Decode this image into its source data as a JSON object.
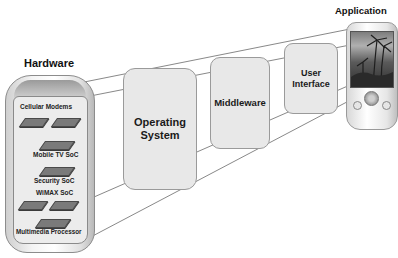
{
  "diagram": {
    "type": "layered-architecture-perspective",
    "colors": {
      "box_fill": "#e8e8e8",
      "box_border": "#9a9a9a",
      "line": "#666666",
      "text": "#1a1a1a",
      "chip": "#7a7a7a"
    },
    "hardware": {
      "label": "Hardware",
      "components": [
        {
          "label": "Cellular Modems"
        },
        {
          "label": "Mobile TV SoC"
        },
        {
          "label": "Security SoC"
        },
        {
          "label": "WiMAX SoC"
        },
        {
          "label": "Multimedia Processor"
        }
      ]
    },
    "layers": [
      {
        "label": "Operating\nSystem"
      },
      {
        "label": "Middleware"
      },
      {
        "label": "User\nInterface"
      }
    ],
    "application": {
      "label": "Application",
      "icon": "phone-with-landscape-screen"
    },
    "edges": [
      {
        "from": "hardware",
        "to": "operating-system"
      },
      {
        "from": "operating-system",
        "to": "middleware"
      },
      {
        "from": "middleware",
        "to": "user-interface"
      },
      {
        "from": "user-interface",
        "to": "application"
      }
    ]
  }
}
